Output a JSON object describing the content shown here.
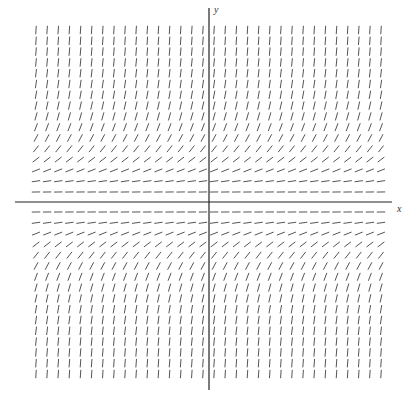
{
  "diagram": {
    "type": "slope_field",
    "x_axis_label": "x",
    "y_axis_label": "y",
    "colors": {
      "segments": "#555555",
      "axes": "#222222",
      "background": "#ffffff"
    }
  },
  "chart_data": {
    "type": "slope_field",
    "equation": "dy/dx = y^2",
    "xlabel": "x",
    "ylabel": "y",
    "columns": 32,
    "rows_above_axis": 16,
    "rows_below_axis": 16,
    "grid": false
  }
}
